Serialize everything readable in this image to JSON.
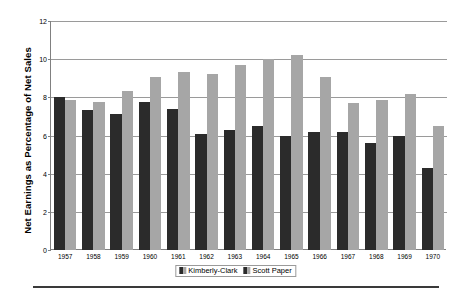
{
  "chart_data": {
    "type": "bar",
    "title": "",
    "xlabel": "",
    "ylabel": "Net Earnings as Percentage of Net Sales",
    "ylim": [
      0,
      12
    ],
    "yticks": [
      0,
      2,
      4,
      6,
      8,
      10,
      12
    ],
    "ytick_labels": [
      "0",
      "2",
      "4",
      "6",
      "8",
      "10",
      "12"
    ],
    "grid": true,
    "legend_position": "bottom-center",
    "categories": [
      "1957",
      "1958",
      "1959",
      "1960",
      "1961",
      "1962",
      "1963",
      "1964",
      "1965",
      "1966",
      "1967",
      "1968",
      "1969",
      "1970"
    ],
    "series": [
      {
        "name": "Kimberly-Clark",
        "color": "#2b2b2b",
        "values": [
          8.0,
          7.35,
          7.15,
          7.75,
          7.4,
          6.1,
          6.3,
          6.5,
          6.0,
          6.2,
          6.2,
          5.6,
          5.95,
          4.3
        ]
      },
      {
        "name": "Scott Paper",
        "color": "#a6a6a6",
        "values": [
          7.85,
          7.75,
          8.35,
          9.05,
          9.35,
          9.2,
          9.7,
          10.0,
          10.2,
          9.05,
          7.7,
          7.85,
          8.15,
          6.5
        ]
      }
    ]
  },
  "legend": {
    "entries": [
      {
        "label": "Kimberly-Clark"
      },
      {
        "label": "Scott Paper"
      }
    ]
  }
}
